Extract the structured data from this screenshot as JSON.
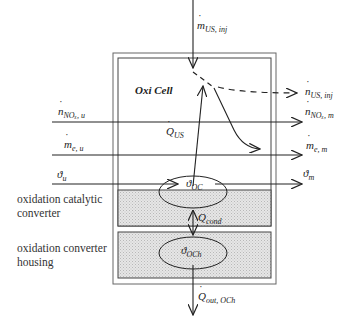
{
  "diagram": {
    "title": "Oxi Cell",
    "colors": {
      "line": "#222222",
      "fill_grey": "#d9d9d9",
      "box_border": "#555555"
    },
    "regions": [
      {
        "id": "oxi-cell",
        "label": "Oxi Cell"
      },
      {
        "id": "catalytic-converter",
        "label_line1": "oxidation catalytic",
        "label_line2": "converter"
      },
      {
        "id": "converter-housing",
        "label_line1": "oxidation converter",
        "label_line2": "housing"
      }
    ],
    "nodes": {
      "theta_oc": {
        "sym": "ϑ",
        "sub": "OC"
      },
      "theta_och": {
        "sym": "ϑ",
        "sub": "OCh"
      }
    },
    "inputs": {
      "m_us_inj": {
        "sym": "m",
        "sub": "US, inj"
      },
      "n_nox_u": {
        "sym": "n",
        "sub": "NOₓ, u"
      },
      "m_e_u": {
        "sym": "m",
        "sub": "e, u"
      },
      "theta_u": {
        "sym": "ϑ",
        "sub": "u"
      }
    },
    "outputs": {
      "n_us_inj": {
        "sym": "n",
        "sub": "US, inj"
      },
      "n_nox_m": {
        "sym": "n",
        "sub": "NOₓ, m"
      },
      "m_e_m": {
        "sym": "m",
        "sub": "e, m"
      },
      "theta_m": {
        "sym": "ϑ",
        "sub": "m"
      }
    },
    "heat_flows": {
      "q_us": {
        "sym": "Q",
        "sub": "US"
      },
      "q_cond": {
        "sym": "Q",
        "sub": "cond"
      },
      "q_out_och": {
        "sym": "Q",
        "sub": "out, OCh"
      }
    }
  }
}
